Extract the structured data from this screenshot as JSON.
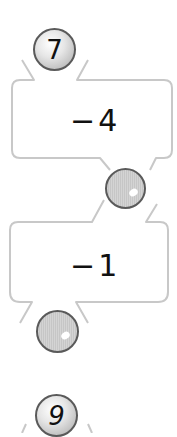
{
  "worksheet": {
    "start_ball": {
      "value": "7"
    },
    "steps": [
      {
        "operation": "−4",
        "result_ball": {
          "value": ""
        }
      },
      {
        "operation": "−1",
        "result_ball": {
          "value": ""
        }
      }
    ],
    "next_start_ball": {
      "value": "9"
    }
  },
  "colors": {
    "outline": "#c8c8c8",
    "ball_border": "#5a5a5a",
    "text": "#111111"
  }
}
